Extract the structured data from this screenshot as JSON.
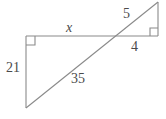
{
  "figure": {
    "background_color": "#ffffff",
    "stroke_color": "#8a8a8a",
    "text_color": "#4a4a4a",
    "labels": {
      "side_left_vertical": "21",
      "side_top_unknown": "x",
      "hypotenuse_large": "35",
      "hypotenuse_small": "5",
      "side_bottom_small": "4"
    },
    "geometry": {
      "points": {
        "top_left": [
          26,
          36
        ],
        "top_right": [
          158,
          36
        ],
        "apex_right": [
          158,
          2
        ],
        "bottom_left": [
          26,
          108
        ]
      },
      "segments": [
        {
          "name": "horizontal-top",
          "from": [
            26,
            36
          ],
          "to": [
            158,
            36
          ]
        },
        {
          "name": "vertical-left",
          "from": [
            26,
            36
          ],
          "to": [
            26,
            108
          ]
        },
        {
          "name": "vertical-right",
          "from": [
            158,
            2
          ],
          "to": [
            158,
            36
          ]
        },
        {
          "name": "diagonal-transversal",
          "from": [
            26,
            108
          ],
          "to": [
            158,
            2
          ]
        }
      ],
      "right_angle_marks": [
        {
          "name": "right-angle-top-left",
          "at": [
            26,
            36
          ],
          "dx": 1,
          "dy": 1
        },
        {
          "name": "right-angle-top-right",
          "at": [
            158,
            36
          ],
          "dx": -1,
          "dy": -1
        }
      ]
    }
  }
}
